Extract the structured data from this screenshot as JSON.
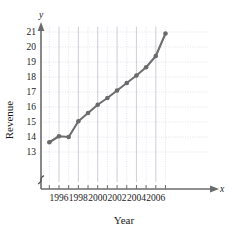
{
  "chart_data": {
    "type": "line",
    "title": "",
    "subtitle": "",
    "xlabel": "Year",
    "ylabel": "Revenue",
    "x_axis_name": "x",
    "y_axis_name": "y",
    "x": [
      1995,
      1996,
      1997,
      1998,
      1999,
      2000,
      2001,
      2002,
      2003,
      2004,
      2005,
      2006,
      2007
    ],
    "values": [
      13.65,
      14.05,
      14.0,
      15.05,
      15.6,
      16.15,
      16.6,
      17.1,
      17.6,
      18.1,
      18.65,
      19.4,
      20.9
    ],
    "series": [
      {
        "name": "Revenue",
        "values": [
          13.65,
          14.05,
          14.0,
          15.05,
          15.6,
          16.15,
          16.6,
          17.1,
          17.6,
          18.1,
          18.65,
          19.4,
          20.9
        ]
      }
    ],
    "xlim": [
      1994.6,
      2007.6
    ],
    "ylim": [
      12.6,
      21.35
    ],
    "xticks": [
      1996,
      1998,
      2000,
      2002,
      2004,
      2006
    ],
    "xtick_labels": [
      "1996",
      "1998",
      "2000",
      "2002",
      "2004",
      "2006"
    ],
    "yticks": [
      13,
      14,
      15,
      16,
      17,
      18,
      19,
      20,
      21
    ],
    "ytick_labels": [
      "13",
      "14",
      "15",
      "16",
      "17",
      "18",
      "19",
      "20",
      "21"
    ],
    "grid": true,
    "grid_style": "dotted",
    "legend": false,
    "legend_position": "none",
    "y_axis_break": true,
    "marker": "circle",
    "line_color": "#6f6f6f",
    "marker_color": "#6a6a6a",
    "grid_color": "#c9c9d6",
    "axis_color": "#6b6b6b",
    "text_color": "#1a1a1a",
    "annotations": []
  },
  "figure": {
    "background": "#ffffff",
    "width": 237,
    "height": 234
  }
}
